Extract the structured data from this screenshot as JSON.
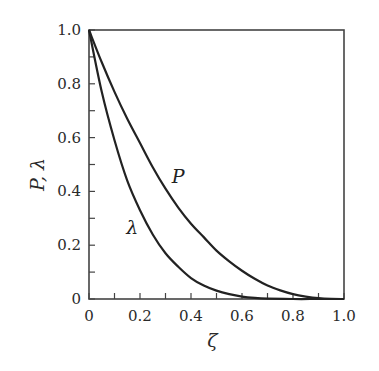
{
  "chart_data": {
    "type": "line",
    "title": "",
    "xlabel": "ζ",
    "ylabel": "P, λ",
    "xlim": [
      0,
      1.0
    ],
    "ylim": [
      0,
      1.0
    ],
    "grid": false,
    "legend": "none (inline curve labels)",
    "x_ticks": [
      0,
      0.2,
      0.4,
      0.6,
      0.8,
      1.0
    ],
    "x_tick_labels": [
      "0",
      "0.2",
      "0.4",
      "0.6",
      "0.8",
      "1.0"
    ],
    "x_minor_step": 0.1,
    "y_ticks": [
      0,
      0.2,
      0.4,
      0.6,
      0.8,
      1.0
    ],
    "y_tick_labels": [
      "0",
      "0.2",
      "0.4",
      "0.6",
      "0.8",
      "1.0"
    ],
    "y_minor_step": 0.1,
    "series": [
      {
        "name": "P",
        "label_pos": [
          0.35,
          0.43
        ],
        "x": [
          0,
          0.05,
          0.1,
          0.15,
          0.2,
          0.25,
          0.3,
          0.35,
          0.4,
          0.45,
          0.5,
          0.55,
          0.6,
          0.65,
          0.7,
          0.75,
          0.8,
          0.85,
          0.9,
          0.95,
          1.0
        ],
        "values": [
          1.0,
          0.88,
          0.77,
          0.67,
          0.58,
          0.49,
          0.41,
          0.34,
          0.28,
          0.23,
          0.18,
          0.14,
          0.105,
          0.075,
          0.05,
          0.032,
          0.018,
          0.009,
          0.003,
          0.0005,
          0
        ]
      },
      {
        "name": "λ",
        "label_pos": [
          0.17,
          0.24
        ],
        "x": [
          0,
          0.05,
          0.1,
          0.15,
          0.2,
          0.25,
          0.3,
          0.35,
          0.4,
          0.45,
          0.5,
          0.55,
          0.6,
          0.65,
          0.7,
          0.8,
          0.9,
          1.0
        ],
        "values": [
          1.0,
          0.77,
          0.59,
          0.44,
          0.33,
          0.24,
          0.17,
          0.12,
          0.078,
          0.05,
          0.031,
          0.018,
          0.009,
          0.004,
          0.0015,
          0,
          0,
          0
        ]
      }
    ]
  }
}
